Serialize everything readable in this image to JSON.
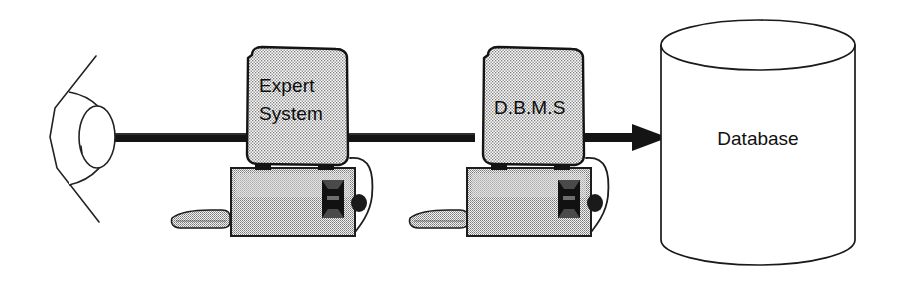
{
  "diagram": {
    "type": "block-flow-diagram",
    "background_color": "#ffffff",
    "line_color": "#111111",
    "fill_stipple_color": "#8a8a8a",
    "nodes": [
      {
        "id": "viewer",
        "data_name": "eye-icon",
        "label": "",
        "shape": "eye",
        "x": 48,
        "y": 62,
        "width": 72,
        "height": 150
      },
      {
        "id": "expert-system",
        "data_name": "expert-system-computer",
        "label_line1": "Expert",
        "label_line2": "System",
        "shape": "computer",
        "x": 231,
        "y": 48,
        "width": 124,
        "height": 190
      },
      {
        "id": "dbms",
        "data_name": "dbms-computer",
        "label_line1": "D.B.M.S",
        "label_line2": "",
        "shape": "computer",
        "x": 467,
        "y": 48,
        "width": 124,
        "height": 190
      },
      {
        "id": "database",
        "data_name": "database-cylinder",
        "label": "Database",
        "shape": "cylinder",
        "x": 661,
        "y": 20,
        "width": 194,
        "height": 245
      }
    ],
    "connectors": [
      {
        "id": "viewer-to-expert",
        "data_name": "connector-viewer-to-expert-system",
        "from": "viewer",
        "to": "expert-system",
        "style": "thick-bar",
        "arrowhead": false
      },
      {
        "id": "expert-to-dbms",
        "data_name": "connector-expert-system-to-dbms",
        "from": "expert-system",
        "to": "dbms",
        "style": "thick-bar",
        "arrowhead": false
      },
      {
        "id": "dbms-to-database",
        "data_name": "connector-dbms-to-database",
        "from": "dbms",
        "to": "database",
        "style": "thick-bar",
        "arrowhead": true
      }
    ],
    "labels": {
      "expert_system_line1": "Expert",
      "expert_system_line2": "System",
      "dbms": "D.B.M.S",
      "database": "Database"
    }
  }
}
